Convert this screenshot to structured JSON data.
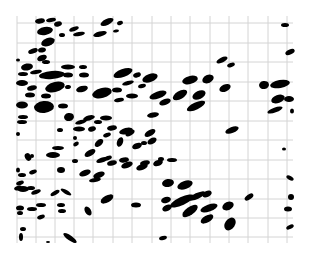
{
  "image": {
    "description": "Binary image of dark elongated elliptical particles scattered over a light gray square grid",
    "background_color": "#ffffff",
    "grid_color": "#d4d4d4",
    "blob_color": "#000000",
    "plot_region": {
      "x0": 17,
      "y0": 16,
      "x1": 293,
      "y1": 243
    },
    "grid": {
      "vertical_lines_x": [
        17,
        36,
        55,
        74,
        93,
        113,
        132,
        152,
        171,
        190,
        210,
        229,
        248,
        268,
        287
      ],
      "horizontal_lines_y": [
        23,
        43,
        62,
        82,
        101,
        121,
        140,
        160,
        179,
        199,
        218,
        237
      ]
    },
    "blobs": [
      {
        "cx": 40,
        "cy": 21,
        "rx": 5,
        "ry": 2.5,
        "rot": -10
      },
      {
        "cx": 51,
        "cy": 20,
        "rx": 5,
        "ry": 2,
        "rot": -10
      },
      {
        "cx": 58,
        "cy": 24,
        "rx": 4,
        "ry": 2.5,
        "rot": -15
      },
      {
        "cx": 45,
        "cy": 31,
        "rx": 8,
        "ry": 4,
        "rot": -10
      },
      {
        "cx": 62,
        "cy": 35,
        "rx": 3,
        "ry": 2,
        "rot": 0
      },
      {
        "cx": 74,
        "cy": 29,
        "rx": 5,
        "ry": 2,
        "rot": -20
      },
      {
        "cx": 79,
        "cy": 34,
        "rx": 6,
        "ry": 2,
        "rot": -10
      },
      {
        "cx": 107,
        "cy": 22,
        "rx": 7,
        "ry": 3,
        "rot": -25
      },
      {
        "cx": 120,
        "cy": 23,
        "rx": 3,
        "ry": 2,
        "rot": -20
      },
      {
        "cx": 100,
        "cy": 34,
        "rx": 7,
        "ry": 2.5,
        "rot": -15
      },
      {
        "cx": 116,
        "cy": 31,
        "rx": 3,
        "ry": 1.5,
        "rot": -10
      },
      {
        "cx": 48,
        "cy": 42,
        "rx": 7,
        "ry": 4,
        "rot": -20
      },
      {
        "cx": 42,
        "cy": 50,
        "rx": 4,
        "ry": 2.5,
        "rot": -10
      },
      {
        "cx": 33,
        "cy": 51,
        "rx": 5,
        "ry": 2.5,
        "rot": -20
      },
      {
        "cx": 42,
        "cy": 58,
        "rx": 5,
        "ry": 3,
        "rot": -20
      },
      {
        "cx": 46,
        "cy": 62,
        "rx": 4,
        "ry": 2,
        "rot": 0
      },
      {
        "cx": 18,
        "cy": 60,
        "rx": 2,
        "ry": 1.5,
        "rot": 0
      },
      {
        "cx": 27,
        "cy": 67,
        "rx": 6,
        "ry": 3.5,
        "rot": -10
      },
      {
        "cx": 36,
        "cy": 72,
        "rx": 6,
        "ry": 2,
        "rot": -10
      },
      {
        "cx": 23,
        "cy": 74,
        "rx": 5,
        "ry": 2,
        "rot": 0
      },
      {
        "cx": 52,
        "cy": 75,
        "rx": 13,
        "ry": 4,
        "rot": -5
      },
      {
        "cx": 68,
        "cy": 67,
        "rx": 7,
        "ry": 2.5,
        "rot": 0
      },
      {
        "cx": 83,
        "cy": 67,
        "rx": 4,
        "ry": 2,
        "rot": 0
      },
      {
        "cx": 84,
        "cy": 75,
        "rx": 5,
        "ry": 2.5,
        "rot": 0
      },
      {
        "cx": 68,
        "cy": 75,
        "rx": 5,
        "ry": 2.5,
        "rot": 0
      },
      {
        "cx": 123,
        "cy": 73,
        "rx": 10,
        "ry": 4,
        "rot": -20
      },
      {
        "cx": 137,
        "cy": 75,
        "rx": 4,
        "ry": 2.5,
        "rot": -20
      },
      {
        "cx": 150,
        "cy": 78,
        "rx": 8,
        "ry": 4,
        "rot": -20
      },
      {
        "cx": 128,
        "cy": 83,
        "rx": 6,
        "ry": 2,
        "rot": -15
      },
      {
        "cx": 142,
        "cy": 86,
        "rx": 4,
        "ry": 2,
        "rot": -15
      },
      {
        "cx": 190,
        "cy": 80,
        "rx": 8,
        "ry": 4,
        "rot": -15
      },
      {
        "cx": 208,
        "cy": 79,
        "rx": 6,
        "ry": 4,
        "rot": -25
      },
      {
        "cx": 222,
        "cy": 60,
        "rx": 6,
        "ry": 2.5,
        "rot": -25
      },
      {
        "cx": 231,
        "cy": 65,
        "rx": 4,
        "ry": 2,
        "rot": -20
      },
      {
        "cx": 285,
        "cy": 25,
        "rx": 4,
        "ry": 2,
        "rot": 0
      },
      {
        "cx": 290,
        "cy": 52,
        "rx": 5,
        "ry": 2.5,
        "rot": -25
      },
      {
        "cx": 22,
        "cy": 83,
        "rx": 6,
        "ry": 3,
        "rot": 0
      },
      {
        "cx": 32,
        "cy": 88,
        "rx": 5,
        "ry": 2.5,
        "rot": -15
      },
      {
        "cx": 55,
        "cy": 87,
        "rx": 10,
        "ry": 5,
        "rot": -15
      },
      {
        "cx": 68,
        "cy": 87,
        "rx": 3,
        "ry": 2,
        "rot": -10
      },
      {
        "cx": 30,
        "cy": 95,
        "rx": 5,
        "ry": 2.5,
        "rot": 0
      },
      {
        "cx": 46,
        "cy": 96,
        "rx": 5,
        "ry": 2.5,
        "rot": 0
      },
      {
        "cx": 82,
        "cy": 89,
        "rx": 6,
        "ry": 3,
        "rot": -15
      },
      {
        "cx": 102,
        "cy": 93,
        "rx": 10,
        "ry": 5,
        "rot": -15
      },
      {
        "cx": 117,
        "cy": 90,
        "rx": 5,
        "ry": 2.5,
        "rot": 0
      },
      {
        "cx": 132,
        "cy": 96,
        "rx": 6,
        "ry": 2.5,
        "rot": 0
      },
      {
        "cx": 119,
        "cy": 100,
        "rx": 5,
        "ry": 2,
        "rot": -10
      },
      {
        "cx": 158,
        "cy": 95,
        "rx": 9,
        "ry": 3.5,
        "rot": -20
      },
      {
        "cx": 165,
        "cy": 102,
        "rx": 6,
        "ry": 3,
        "rot": -20
      },
      {
        "cx": 180,
        "cy": 95,
        "rx": 8,
        "ry": 4,
        "rot": -30
      },
      {
        "cx": 199,
        "cy": 95,
        "rx": 7,
        "ry": 4,
        "rot": -25
      },
      {
        "cx": 196,
        "cy": 106,
        "rx": 10,
        "ry": 3.5,
        "rot": -25
      },
      {
        "cx": 225,
        "cy": 88,
        "rx": 6,
        "ry": 3.5,
        "rot": -25
      },
      {
        "cx": 264,
        "cy": 85,
        "rx": 5,
        "ry": 4,
        "rot": -10
      },
      {
        "cx": 280,
        "cy": 84,
        "rx": 10,
        "ry": 4,
        "rot": -10
      },
      {
        "cx": 278,
        "cy": 99,
        "rx": 7,
        "ry": 4,
        "rot": -20
      },
      {
        "cx": 289,
        "cy": 99,
        "rx": 5,
        "ry": 3,
        "rot": 0
      },
      {
        "cx": 275,
        "cy": 110,
        "rx": 8,
        "ry": 2.5,
        "rot": -20
      },
      {
        "cx": 292,
        "cy": 111,
        "rx": 2,
        "ry": 2.5,
        "rot": 0
      },
      {
        "cx": 22,
        "cy": 105,
        "rx": 6,
        "ry": 3.5,
        "rot": 0
      },
      {
        "cx": 44,
        "cy": 107,
        "rx": 10,
        "ry": 6,
        "rot": -5
      },
      {
        "cx": 63,
        "cy": 106,
        "rx": 5,
        "ry": 2.5,
        "rot": 0
      },
      {
        "cx": 23,
        "cy": 117,
        "rx": 5,
        "ry": 2,
        "rot": 0
      },
      {
        "cx": 22,
        "cy": 122,
        "rx": 5,
        "ry": 2,
        "rot": 0
      },
      {
        "cx": 69,
        "cy": 117,
        "rx": 5,
        "ry": 4,
        "rot": -10
      },
      {
        "cx": 81,
        "cy": 122,
        "rx": 6,
        "ry": 2,
        "rot": -15
      },
      {
        "cx": 89,
        "cy": 118,
        "rx": 6,
        "ry": 2.5,
        "rot": -15
      },
      {
        "cx": 98,
        "cy": 122,
        "rx": 4,
        "ry": 2,
        "rot": 0
      },
      {
        "cx": 106,
        "cy": 118,
        "rx": 6,
        "ry": 2.5,
        "rot": 0
      },
      {
        "cx": 153,
        "cy": 115,
        "rx": 6,
        "ry": 2.5,
        "rot": -10
      },
      {
        "cx": 232,
        "cy": 130,
        "rx": 7,
        "ry": 3,
        "rot": -20
      },
      {
        "cx": 79,
        "cy": 129,
        "rx": 6,
        "ry": 2.5,
        "rot": 0
      },
      {
        "cx": 92,
        "cy": 129,
        "rx": 4,
        "ry": 2.5,
        "rot": -15
      },
      {
        "cx": 112,
        "cy": 128,
        "rx": 5,
        "ry": 2.5,
        "rot": -10
      },
      {
        "cx": 107,
        "cy": 135,
        "rx": 4,
        "ry": 2,
        "rot": -20
      },
      {
        "cx": 130,
        "cy": 133,
        "rx": 5,
        "ry": 2.5,
        "rot": -30
      },
      {
        "cx": 60,
        "cy": 130,
        "rx": 3,
        "ry": 2,
        "rot": 0
      },
      {
        "cx": 75,
        "cy": 138,
        "rx": 2,
        "ry": 2,
        "rot": 0
      },
      {
        "cx": 18,
        "cy": 134,
        "rx": 2,
        "ry": 2,
        "rot": 0
      },
      {
        "cx": 126,
        "cy": 131,
        "rx": 7,
        "ry": 3,
        "rot": -15
      },
      {
        "cx": 150,
        "cy": 133,
        "rx": 6,
        "ry": 3,
        "rot": -30
      },
      {
        "cx": 58,
        "cy": 148,
        "rx": 6,
        "ry": 2,
        "rot": 0
      },
      {
        "cx": 53,
        "cy": 155,
        "rx": 7,
        "ry": 3,
        "rot": 0
      },
      {
        "cx": 76,
        "cy": 144,
        "rx": 3,
        "ry": 2,
        "rot": -30
      },
      {
        "cx": 90,
        "cy": 153,
        "rx": 6,
        "ry": 3,
        "rot": -30
      },
      {
        "cx": 99,
        "cy": 143,
        "rx": 5,
        "ry": 3,
        "rot": -40
      },
      {
        "cx": 102,
        "cy": 160,
        "rx": 6,
        "ry": 2.5,
        "rot": -20
      },
      {
        "cx": 120,
        "cy": 142,
        "rx": 3,
        "ry": 5,
        "rot": 20
      },
      {
        "cx": 137,
        "cy": 146,
        "rx": 5,
        "ry": 3,
        "rot": -20
      },
      {
        "cx": 144,
        "cy": 143,
        "rx": 3,
        "ry": 2,
        "rot": 0
      },
      {
        "cx": 152,
        "cy": 141,
        "rx": 5,
        "ry": 3,
        "rot": -30
      },
      {
        "cx": 28,
        "cy": 157,
        "rx": 3,
        "ry": 4,
        "rot": -30
      },
      {
        "cx": 32,
        "cy": 156,
        "rx": 2,
        "ry": 2,
        "rot": 0
      },
      {
        "cx": 75,
        "cy": 161,
        "rx": 3,
        "ry": 2,
        "rot": 0
      },
      {
        "cx": 108,
        "cy": 158,
        "rx": 4,
        "ry": 2,
        "rot": -20
      },
      {
        "cx": 112,
        "cy": 163,
        "rx": 5,
        "ry": 2.5,
        "rot": -15
      },
      {
        "cx": 124,
        "cy": 160,
        "rx": 5,
        "ry": 2.5,
        "rot": -10
      },
      {
        "cx": 127,
        "cy": 165,
        "rx": 6,
        "ry": 3,
        "rot": -20
      },
      {
        "cx": 145,
        "cy": 163,
        "rx": 5,
        "ry": 2.5,
        "rot": -15
      },
      {
        "cx": 142,
        "cy": 167,
        "rx": 6,
        "ry": 3,
        "rot": -20
      },
      {
        "cx": 161,
        "cy": 159,
        "rx": 3,
        "ry": 2,
        "rot": 0
      },
      {
        "cx": 172,
        "cy": 160,
        "rx": 5,
        "ry": 2,
        "rot": 0
      },
      {
        "cx": 18,
        "cy": 170,
        "rx": 2,
        "ry": 2.5,
        "rot": 0
      },
      {
        "cx": 22,
        "cy": 175,
        "rx": 4,
        "ry": 2,
        "rot": 0
      },
      {
        "cx": 33,
        "cy": 172,
        "rx": 4,
        "ry": 2,
        "rot": -20
      },
      {
        "cx": 61,
        "cy": 170,
        "rx": 4,
        "ry": 3,
        "rot": 0
      },
      {
        "cx": 85,
        "cy": 173,
        "rx": 6,
        "ry": 3,
        "rot": -20
      },
      {
        "cx": 99,
        "cy": 175,
        "rx": 6,
        "ry": 3,
        "rot": -20
      },
      {
        "cx": 95,
        "cy": 180,
        "rx": 6,
        "ry": 2,
        "rot": -10
      },
      {
        "cx": 20,
        "cy": 183,
        "rx": 4,
        "ry": 2,
        "rot": -20
      },
      {
        "cx": 18,
        "cy": 188,
        "rx": 4,
        "ry": 2,
        "rot": -20
      },
      {
        "cx": 23,
        "cy": 189,
        "rx": 6,
        "ry": 3,
        "rot": 0
      },
      {
        "cx": 31,
        "cy": 188,
        "rx": 4,
        "ry": 2,
        "rot": 0
      },
      {
        "cx": 36,
        "cy": 192,
        "rx": 5,
        "ry": 2,
        "rot": -20
      },
      {
        "cx": 55,
        "cy": 193,
        "rx": 5,
        "ry": 2,
        "rot": -30
      },
      {
        "cx": 66,
        "cy": 192,
        "rx": 6,
        "ry": 2,
        "rot": 30
      },
      {
        "cx": 107,
        "cy": 199,
        "rx": 7,
        "ry": 3.5,
        "rot": -30
      },
      {
        "cx": 168,
        "cy": 183,
        "rx": 6,
        "ry": 4,
        "rot": -10
      },
      {
        "cx": 185,
        "cy": 185,
        "rx": 8,
        "ry": 4,
        "rot": -20
      },
      {
        "cx": 158,
        "cy": 163,
        "rx": 5,
        "ry": 3,
        "rot": -20
      },
      {
        "cx": 20,
        "cy": 208,
        "rx": 4,
        "ry": 2.5,
        "rot": 0
      },
      {
        "cx": 32,
        "cy": 209,
        "rx": 5,
        "ry": 2,
        "rot": 0
      },
      {
        "cx": 41,
        "cy": 205,
        "rx": 5,
        "ry": 2,
        "rot": 0
      },
      {
        "cx": 62,
        "cy": 211,
        "rx": 4,
        "ry": 2,
        "rot": 0
      },
      {
        "cx": 61,
        "cy": 205,
        "rx": 4,
        "ry": 2,
        "rot": 0
      },
      {
        "cx": 88,
        "cy": 211,
        "rx": 3,
        "ry": 5,
        "rot": -30
      },
      {
        "cx": 136,
        "cy": 205,
        "rx": 5,
        "ry": 2.5,
        "rot": 0
      },
      {
        "cx": 166,
        "cy": 200,
        "rx": 5,
        "ry": 3,
        "rot": -15
      },
      {
        "cx": 167,
        "cy": 208,
        "rx": 5,
        "ry": 3,
        "rot": -25
      },
      {
        "cx": 182,
        "cy": 201,
        "rx": 13,
        "ry": 4,
        "rot": -25
      },
      {
        "cx": 197,
        "cy": 196,
        "rx": 9,
        "ry": 3,
        "rot": -25
      },
      {
        "cx": 207,
        "cy": 194,
        "rx": 5,
        "ry": 3,
        "rot": -25
      },
      {
        "cx": 190,
        "cy": 211,
        "rx": 9,
        "ry": 4,
        "rot": -35
      },
      {
        "cx": 209,
        "cy": 208,
        "rx": 9,
        "ry": 3.5,
        "rot": -20
      },
      {
        "cx": 228,
        "cy": 206,
        "rx": 6,
        "ry": 4,
        "rot": -25
      },
      {
        "cx": 207,
        "cy": 219,
        "rx": 7,
        "ry": 3.5,
        "rot": -30
      },
      {
        "cx": 230,
        "cy": 224,
        "rx": 5,
        "ry": 7,
        "rot": 35
      },
      {
        "cx": 249,
        "cy": 197,
        "rx": 5,
        "ry": 2.5,
        "rot": -35
      },
      {
        "cx": 284,
        "cy": 149,
        "rx": 2,
        "ry": 1.5,
        "rot": 0
      },
      {
        "cx": 290,
        "cy": 178,
        "rx": 4,
        "ry": 2,
        "rot": 30
      },
      {
        "cx": 291,
        "cy": 197,
        "rx": 3,
        "ry": 3,
        "rot": 0
      },
      {
        "cx": 288,
        "cy": 209,
        "rx": 4,
        "ry": 2.5,
        "rot": 0
      },
      {
        "cx": 290,
        "cy": 227,
        "rx": 4,
        "ry": 2,
        "rot": -25
      },
      {
        "cx": 163,
        "cy": 238,
        "rx": 4,
        "ry": 2,
        "rot": -15
      },
      {
        "cx": 21,
        "cy": 237,
        "rx": 2,
        "ry": 4,
        "rot": 0
      },
      {
        "cx": 48,
        "cy": 242,
        "rx": 2,
        "ry": 1,
        "rot": 0
      },
      {
        "cx": 70,
        "cy": 238,
        "rx": 8,
        "ry": 2.5,
        "rot": 35
      },
      {
        "cx": 20,
        "cy": 213,
        "rx": 3,
        "ry": 2,
        "rot": 0
      },
      {
        "cx": 41,
        "cy": 217,
        "rx": 4,
        "ry": 2,
        "rot": -20
      },
      {
        "cx": 23,
        "cy": 229,
        "rx": 3,
        "ry": 2,
        "rot": 0
      }
    ]
  }
}
